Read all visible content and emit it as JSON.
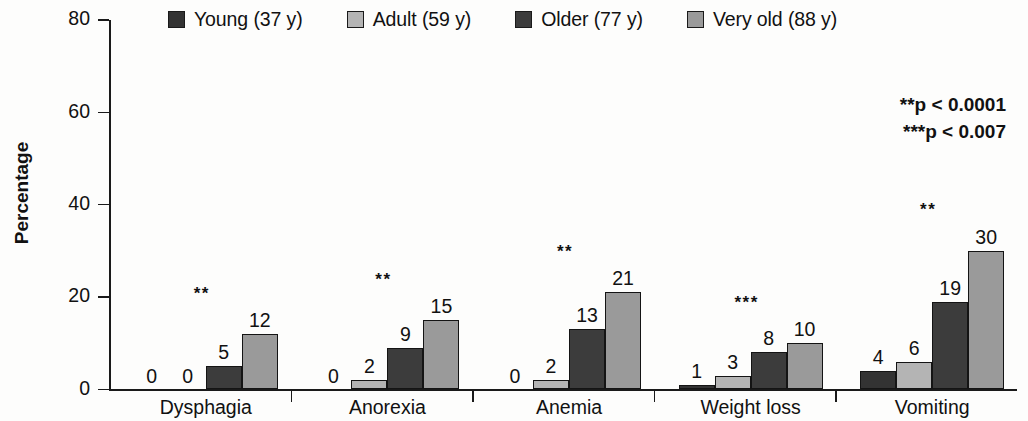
{
  "chart_data": {
    "type": "bar",
    "title": "",
    "xlabel": "",
    "ylabel": "Percentage",
    "ylim": [
      0,
      80
    ],
    "yticks": [
      0,
      20,
      40,
      60,
      80
    ],
    "ytick_labels": [
      "0",
      "20",
      "40",
      "60",
      "80"
    ],
    "grid": false,
    "legend_position": "top",
    "categories": [
      "Dysphagia",
      "Anorexia",
      "Anemia",
      "Weight loss",
      "Vomiting"
    ],
    "series": [
      {
        "name": "Young (37 y)",
        "color": "#333333",
        "values": [
          0,
          0,
          0,
          1,
          4
        ],
        "value_labels": [
          "0",
          "0",
          "0",
          "1",
          "4"
        ]
      },
      {
        "name": "Adult (59 y)",
        "color": "#b4b4b4",
        "values": [
          0,
          2,
          2,
          3,
          6
        ],
        "value_labels": [
          "0",
          "2",
          "2",
          "3",
          "6"
        ]
      },
      {
        "name": "Older (77 y)",
        "color": "#3c3c3c",
        "values": [
          5,
          9,
          13,
          8,
          19
        ],
        "value_labels": [
          "5",
          "9",
          "13",
          "8",
          "19"
        ]
      },
      {
        "name": "Very old (88 y)",
        "color": "#9a9a9a",
        "values": [
          12,
          15,
          21,
          10,
          30
        ],
        "value_labels": [
          "12",
          "15",
          "21",
          "10",
          "30"
        ]
      }
    ],
    "significance_markers": [
      "**",
      "**",
      "**",
      "***",
      "**"
    ],
    "annotations": [
      "**p < 0.0001",
      "***p < 0.007"
    ]
  },
  "legend": {
    "items": [
      {
        "label": "Young (37 y)",
        "color": "#333333"
      },
      {
        "label": "Adult (59 y)",
        "color": "#b4b4b4"
      },
      {
        "label": "Older (77 y)",
        "color": "#3c3c3c"
      },
      {
        "label": "Very old (88 y)",
        "color": "#9a9a9a"
      }
    ]
  },
  "axis": {
    "y_title": "Percentage"
  }
}
